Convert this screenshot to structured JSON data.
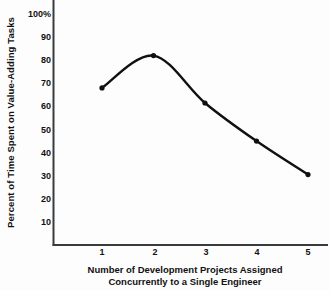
{
  "chart_data": {
    "type": "line",
    "title": "",
    "subtitle": "",
    "xlabel_line1": "Number of Development Projects Assigned",
    "xlabel_line2": "Concurrently to a Single Engineer",
    "ylabel": "Percent of Time Spent on Value-Adding Tasks",
    "categories": [
      1,
      2,
      3,
      4,
      5
    ],
    "x": [
      1,
      2,
      3,
      4,
      5
    ],
    "values": [
      68,
      82,
      61.5,
      45,
      30.5
    ],
    "series": [
      {
        "name": "Percent of Time Spent on Value-Adding Tasks",
        "values": [
          68,
          82,
          61.5,
          45,
          30.5
        ]
      }
    ],
    "xtick_labels": [
      "1",
      "2",
      "3",
      "4",
      "5"
    ],
    "ytick_labels": [
      "100%",
      "90",
      "80",
      "70",
      "60",
      "50",
      "40",
      "30",
      "20",
      "10"
    ],
    "ytick_values": [
      100,
      90,
      80,
      70,
      60,
      50,
      40,
      30,
      20,
      10
    ],
    "ylim": [
      5,
      104
    ],
    "xlim": [
      0.35,
      5.6
    ],
    "grid": false,
    "legend": false,
    "legend_position": "none",
    "marker": "circle",
    "line_color": "#101010",
    "marker_color": "#101010",
    "axis_color": "#3a3a3a",
    "background_color": "#fdfdfd",
    "smoothing": "spline"
  }
}
